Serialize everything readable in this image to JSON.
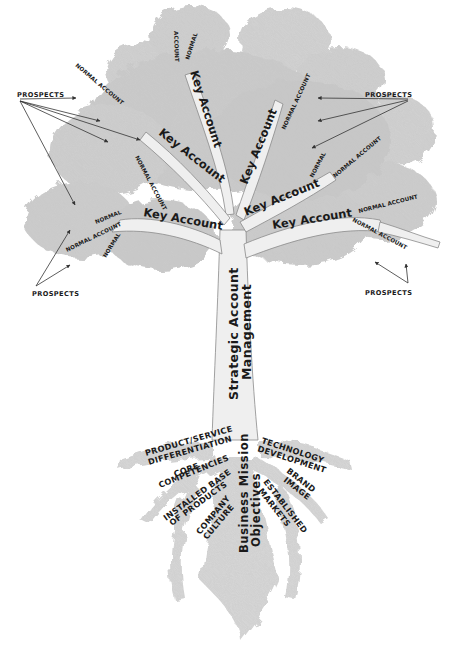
{
  "diagram": {
    "type": "metaphor-tree",
    "colors": {
      "foliage": "#c9c9c9",
      "foliage_dark": "#a8a8a8",
      "branch": "#eeeeee",
      "outline": "#8a8a8a",
      "text": "#1a1a1a",
      "background": "#ffffff"
    },
    "trunk": {
      "line1": "Strategic Account",
      "line2": "Management"
    },
    "taproot": {
      "line1": "Business Mission",
      "line2": "Objectives"
    },
    "branches": {
      "key_account": "Key Account",
      "normal_account": "NORMAL ACCOUNT",
      "normal": "NORMAL",
      "account": "ACCOUNT"
    },
    "prospects": {
      "label": "PROSPECTS",
      "top_left": "PROSPECTS",
      "top_right": "PROSPECTS",
      "bottom_left": "PROSPECTS",
      "bottom_right": "PROSPECTS"
    },
    "roots": {
      "product_service_1": "PRODUCT/SERVICE",
      "product_service_2": "DIFFERENTIATION",
      "core_1": "CORE",
      "core_2": "COMPETENCIES",
      "installed_1": "INSTALLED BASE",
      "installed_2": "OF PRODUCTS",
      "culture_1": "COMPANY",
      "culture_2": "CULTURE",
      "tech_1": "TECHNOLOGY",
      "tech_2": "DEVELOPMENT",
      "brand_1": "BRAND",
      "brand_2": "IMAGE",
      "markets_1": "ESTABLISHED",
      "markets_2": "MARKETS"
    }
  }
}
